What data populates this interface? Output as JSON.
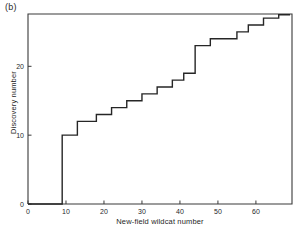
{
  "panel": {
    "label": "(b)"
  },
  "chart_data": {
    "type": "line",
    "title": "",
    "subtitle": "",
    "panel_label": "(b)",
    "xlabel": "New-field wildcat number",
    "ylabel": "Discovery number",
    "xlim": [
      0,
      69.5
    ],
    "ylim": [
      0,
      27.6
    ],
    "grid": false,
    "legend": null,
    "xticks": [
      0,
      10,
      20,
      30,
      40,
      50,
      60
    ],
    "xtick_labels": [
      "0",
      "10",
      "20",
      "30",
      "40",
      "50",
      "60"
    ],
    "yticks": [
      0,
      10,
      20
    ],
    "ytick_labels": [
      "0",
      "10",
      "20"
    ],
    "line_color": "#262626",
    "line_width": 1.4,
    "x": [
      0,
      9,
      10,
      11,
      12,
      13,
      17,
      18,
      21,
      22,
      25,
      26,
      29,
      30,
      33,
      34,
      37,
      38,
      41,
      42,
      43,
      44,
      47,
      48,
      54,
      55,
      57,
      58,
      61,
      62,
      65,
      66,
      67,
      69
    ],
    "y": [
      0,
      10,
      10.6,
      11.2,
      11.8,
      12,
      12,
      13,
      13,
      14,
      14,
      15,
      15,
      16,
      16,
      17,
      17,
      18,
      19,
      20,
      21,
      23,
      23,
      24,
      24,
      25,
      25,
      26,
      26,
      27,
      27,
      27.5,
      27.5,
      27.5
    ],
    "points": [
      {
        "x": 0,
        "y": 0
      },
      {
        "x": 9,
        "y": 10
      },
      {
        "x": 13,
        "y": 12
      },
      {
        "x": 17,
        "y": 12
      },
      {
        "x": 18,
        "y": 13
      },
      {
        "x": 21,
        "y": 13
      },
      {
        "x": 22,
        "y": 14
      },
      {
        "x": 25,
        "y": 14
      },
      {
        "x": 26,
        "y": 15
      },
      {
        "x": 29,
        "y": 15
      },
      {
        "x": 30,
        "y": 16
      },
      {
        "x": 33,
        "y": 16
      },
      {
        "x": 34,
        "y": 17
      },
      {
        "x": 37,
        "y": 17
      },
      {
        "x": 38,
        "y": 18
      },
      {
        "x": 41,
        "y": 19
      },
      {
        "x": 44,
        "y": 23
      },
      {
        "x": 47,
        "y": 23
      },
      {
        "x": 48,
        "y": 24
      },
      {
        "x": 54,
        "y": 24
      },
      {
        "x": 55,
        "y": 25
      },
      {
        "x": 57,
        "y": 25
      },
      {
        "x": 58,
        "y": 26
      },
      {
        "x": 61,
        "y": 26
      },
      {
        "x": 62,
        "y": 27
      },
      {
        "x": 65,
        "y": 27
      },
      {
        "x": 66,
        "y": 27.5
      },
      {
        "x": 69,
        "y": 27.5
      }
    ]
  }
}
